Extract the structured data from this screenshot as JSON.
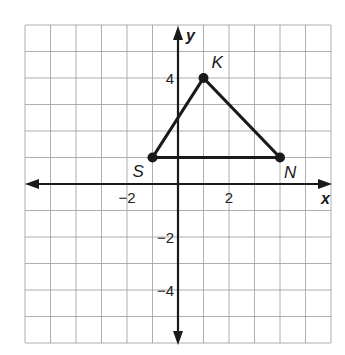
{
  "chart_data": {
    "type": "scatter",
    "title": "",
    "xlabel": "x",
    "ylabel": "y",
    "xlim": [
      -6,
      6
    ],
    "ylim": [
      -6,
      6
    ],
    "grid": true,
    "x_tick_labels": [
      {
        "value": -2,
        "label": "−2"
      },
      {
        "value": 2,
        "label": "2"
      }
    ],
    "y_tick_labels": [
      {
        "value": 4,
        "label": "4"
      },
      {
        "value": -2,
        "label": "−2"
      },
      {
        "value": -4,
        "label": "−4"
      }
    ],
    "points": [
      {
        "name": "K",
        "x": 1,
        "y": 4
      },
      {
        "name": "S",
        "x": -1,
        "y": 1
      },
      {
        "name": "N",
        "x": 4,
        "y": 1
      }
    ],
    "polygon": [
      "S",
      "K",
      "N"
    ]
  },
  "colors": {
    "grid": "#9a9a9a",
    "axis": "#1a1a1a",
    "shape": "#1a1a1a",
    "background": "#ffffff"
  }
}
